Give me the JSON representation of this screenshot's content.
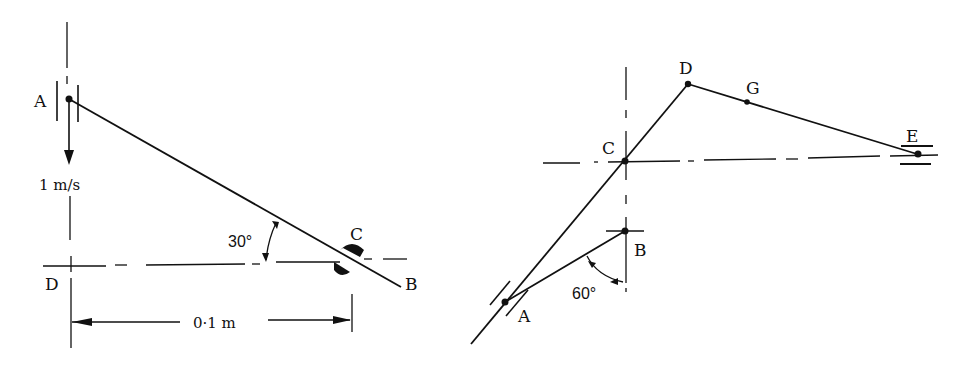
{
  "figure_left": {
    "labels": {
      "A": "A",
      "B": "B",
      "C": "C",
      "D": "D"
    },
    "velocity": "1 m/s",
    "angle": "30°",
    "dimension": "0·1 m"
  },
  "figure_right": {
    "labels": {
      "A": "A",
      "B": "B",
      "C": "C",
      "D": "D",
      "E": "E",
      "G": "G"
    },
    "angle": "60°"
  },
  "colors": {
    "ink": "#111111",
    "background": "#ffffff"
  }
}
